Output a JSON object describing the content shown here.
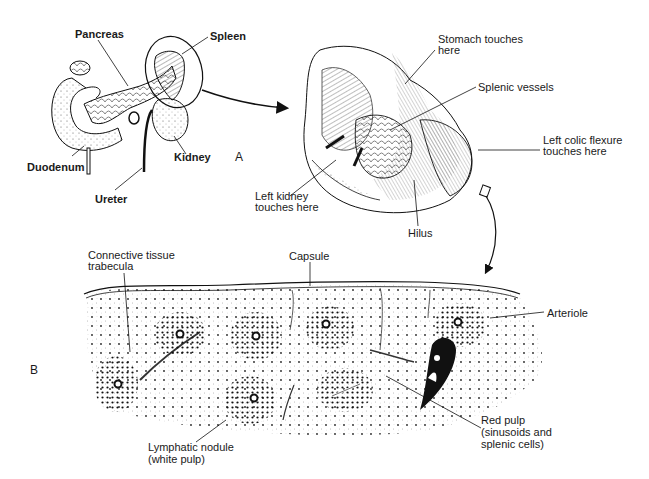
{
  "figure": {
    "panel_a": {
      "panel_label": "A",
      "overview_labels": {
        "pancreas": "Pancreas",
        "spleen": "Spleen",
        "duodenum": "Duodenum",
        "kidney": "Kidney",
        "ureter": "Ureter"
      },
      "spleen_detail_labels": {
        "stomach_line1": "Stomach touches",
        "stomach_line2": "here",
        "splenic_vessels": "Splenic vessels",
        "colic_line1": "Left colic flexure",
        "colic_line2": "touches here",
        "kidney_line1": "Left kidney",
        "kidney_line2": "touches here",
        "hilus": "Hilus"
      }
    },
    "panel_b": {
      "panel_label": "B",
      "labels": {
        "trabecula_line1": "Connective tissue",
        "trabecula_line2": "trabecula",
        "capsule": "Capsule",
        "arteriole": "Arteriole",
        "red_pulp_line1": "Red pulp",
        "red_pulp_line2": "(sinusoids and",
        "red_pulp_line3": "splenic cells)",
        "nodule_line1": "Lymphatic nodule",
        "nodule_line2": "(white pulp)"
      }
    },
    "colors": {
      "ink": "#1a1a1a",
      "background": "#ffffff"
    }
  }
}
